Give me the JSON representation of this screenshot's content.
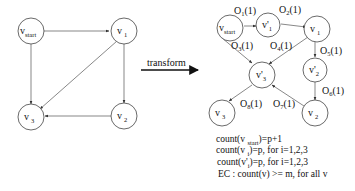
{
  "transform_label": "transform",
  "left_graph": {
    "nodes": [
      {
        "id": "v_start",
        "base": "v",
        "sub": "start"
      },
      {
        "id": "v1",
        "base": "v",
        "sub": "1"
      },
      {
        "id": "v2",
        "base": "v",
        "sub": "2"
      },
      {
        "id": "v3",
        "base": "v",
        "sub": "3"
      }
    ],
    "edges": [
      [
        "v_start",
        "v1"
      ],
      [
        "v_start",
        "v3"
      ],
      [
        "v1",
        "v3"
      ],
      [
        "v1",
        "v2"
      ],
      [
        "v2",
        "v3"
      ]
    ]
  },
  "right_graph": {
    "nodes": [
      {
        "id": "v_start",
        "base": "v",
        "sub": "start"
      },
      {
        "id": "v1p",
        "base": "v'",
        "sub": "1"
      },
      {
        "id": "v1",
        "base": "v",
        "sub": "1"
      },
      {
        "id": "v2p",
        "base": "v'",
        "sub": "2"
      },
      {
        "id": "v3p",
        "base": "v'",
        "sub": "3"
      },
      {
        "id": "v2",
        "base": "v",
        "sub": "2"
      },
      {
        "id": "v3",
        "base": "v",
        "sub": "3"
      }
    ],
    "edges": [
      {
        "from": "v_start",
        "to": "v1p",
        "label": "O",
        "sub": "1",
        "cost": "(1)"
      },
      {
        "from": "v1p",
        "to": "v1",
        "label": "O",
        "sub": "2",
        "cost": "(1)"
      },
      {
        "from": "v_start",
        "to": "v3p",
        "label": "O",
        "sub": "3",
        "cost": "(1)"
      },
      {
        "from": "v1",
        "to": "v3p",
        "label": "O",
        "sub": "4",
        "cost": "(1)"
      },
      {
        "from": "v1",
        "to": "v2p",
        "label": "O",
        "sub": "5",
        "cost": "(1)"
      },
      {
        "from": "v2p",
        "to": "v2",
        "label": "O",
        "sub": "6",
        "cost": "(1)"
      },
      {
        "from": "v2",
        "to": "v3p",
        "label": "O",
        "sub": "7",
        "cost": "(1)"
      },
      {
        "from": "v3p",
        "to": "v3",
        "label": "O",
        "sub": "8",
        "cost": "(1)"
      }
    ]
  },
  "formulas": [
    {
      "pre": "count(v ",
      "sub": "start",
      "post": ")=p+1"
    },
    {
      "pre": "count(v ",
      "sub": "i",
      "post": ")=p, for i=1,2,3"
    },
    {
      "pre": "count(v'",
      "sub": "i",
      "post": ")=p, for i=1,2,3"
    },
    {
      "pre": "EC : count(v) >= m, for all v",
      "sub": "",
      "post": ""
    }
  ]
}
